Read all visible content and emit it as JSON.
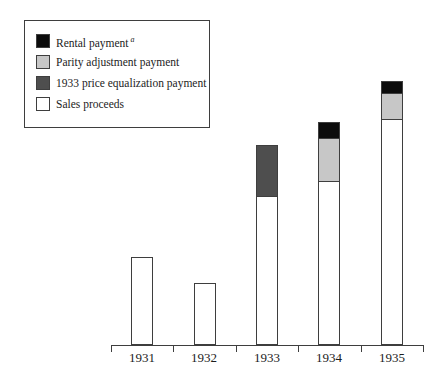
{
  "colors": {
    "rental": "#0c0c0c",
    "parity": "#c7c7c7",
    "equalization": "#4e4e4e",
    "sales": "#ffffff",
    "outline": "#3e3e3e",
    "axis": "#3e3e3e",
    "text": "#1c1c1c",
    "background": "#ffffff"
  },
  "legend": {
    "items": [
      {
        "label": "Rental payment",
        "footnote_marker": "a",
        "swatch": "rental"
      },
      {
        "label": "Parity adjustment payment",
        "footnote_marker": "",
        "swatch": "parity"
      },
      {
        "label": "1933 price equalization payment",
        "footnote_marker": "",
        "swatch": "equalization"
      },
      {
        "label": "Sales proceeds",
        "footnote_marker": "",
        "swatch": "sales"
      }
    ]
  },
  "chart_data": {
    "type": "bar",
    "stacked": true,
    "title": "",
    "xlabel": "",
    "ylabel": "",
    "grid": false,
    "y_axis_shown": false,
    "units": "relative heights estimated from pixels (no value axis shown in figure)",
    "categories": [
      "1931",
      "1932",
      "1933",
      "1934",
      "1935"
    ],
    "series": [
      {
        "name": "Sales proceeds",
        "color_key": "sales",
        "values": [
          86,
          60,
          147,
          162,
          224
        ]
      },
      {
        "name": "1933 price equalization payment",
        "color_key": "equalization",
        "values": [
          0,
          0,
          50,
          0,
          0
        ]
      },
      {
        "name": "Parity adjustment payment",
        "color_key": "parity",
        "values": [
          0,
          0,
          0,
          42,
          25
        ]
      },
      {
        "name": "Rental payment",
        "color_key": "rental",
        "values": [
          0,
          0,
          0,
          15,
          11
        ]
      }
    ],
    "legend_position": "top-left boxed",
    "layout": {
      "axis_left": 111,
      "axis_width": 312,
      "baseline_y": 345,
      "bar_width": 20,
      "tick_length": 7,
      "stage_height": 376
    }
  }
}
